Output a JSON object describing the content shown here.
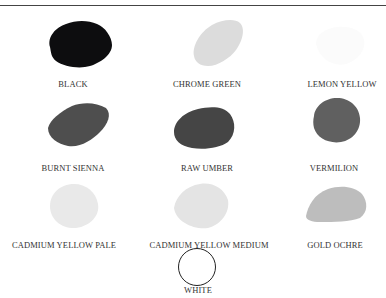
{
  "colors": [
    {
      "name": "BLACK",
      "swatch": "#0d0d0f",
      "label_x": 73,
      "label_y": 82
    },
    {
      "name": "CHROME GREEN",
      "swatch": "#dcdcdc",
      "label_x": 207,
      "label_y": 82
    },
    {
      "name": "LEMON YELLOW",
      "swatch": "#fbfbfb",
      "label_x": 342,
      "label_y": 82
    },
    {
      "name": "BURNT SIENNA",
      "swatch": "#4e4e4e",
      "label_x": 73,
      "label_y": 166
    },
    {
      "name": "RAW UMBER",
      "swatch": "#454545",
      "label_x": 207,
      "label_y": 166
    },
    {
      "name": "VERMILION",
      "swatch": "#606060",
      "label_x": 334,
      "label_y": 166
    },
    {
      "name": "CADMIUM YELLOW PALE",
      "swatch": "#e9e9e9",
      "label_x": 64,
      "label_y": 243
    },
    {
      "name": "CADMIUM YELLOW MEDIUM",
      "swatch": "#e4e4e4",
      "label_x": 209,
      "label_y": 243
    },
    {
      "name": "GOLD OCHRE",
      "swatch": "#bdbdbd",
      "label_x": 335,
      "label_y": 243
    },
    {
      "name": "WHITE",
      "swatch": "#ffffff",
      "label_x": 198,
      "label_y": 286
    }
  ]
}
